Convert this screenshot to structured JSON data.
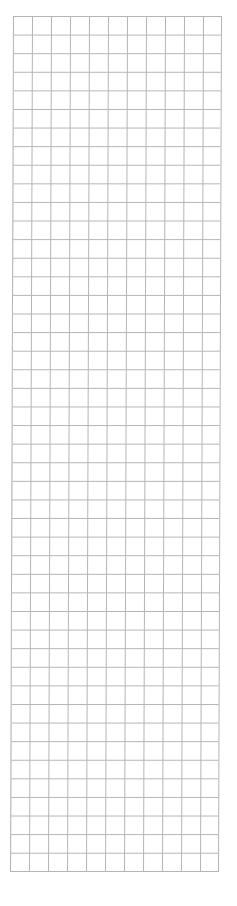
{
  "grid": {
    "columns": 11,
    "rows": 46,
    "line_color": "#b4b4b4",
    "background": "#ffffff"
  }
}
